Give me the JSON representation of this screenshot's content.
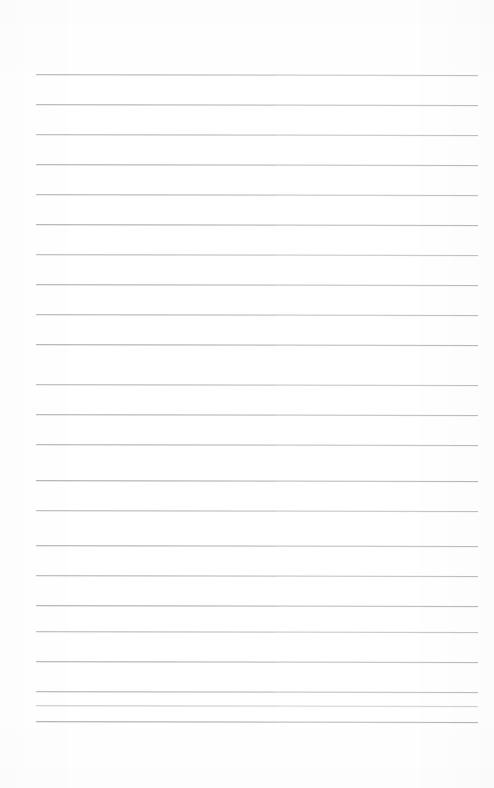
{
  "page": {
    "kind": "ruled-notebook-paper-scan",
    "width": 494,
    "height": 788,
    "background_color": "#ffffff",
    "content_text": "",
    "visible_text_count": 0
  },
  "ruling": {
    "line_color": "#b9b9bd",
    "line_thickness": 1,
    "line_count": 23,
    "line_spacing": 30.1,
    "first_line_y": 74,
    "last_line_y": 721,
    "line_left_x": 36,
    "line_right_x": 478,
    "line_width": 442,
    "slant_degrees": 0.12,
    "lines": [
      {
        "index": 1,
        "y": 74,
        "x": 36,
        "width": 442,
        "color": "#bcbcc0",
        "opacity": 0.95
      },
      {
        "index": 2,
        "y": 104,
        "x": 36,
        "width": 442,
        "color": "#babac0",
        "opacity": 0.97
      },
      {
        "index": 3,
        "y": 134,
        "x": 36,
        "width": 442,
        "color": "#bcbcc1",
        "opacity": 0.93
      },
      {
        "index": 4,
        "y": 164,
        "x": 36,
        "width": 442,
        "color": "#b9b9be",
        "opacity": 0.98
      },
      {
        "index": 5,
        "y": 194,
        "x": 36,
        "width": 442,
        "color": "#bbbbc0",
        "opacity": 0.95
      },
      {
        "index": 6,
        "y": 224,
        "x": 36,
        "width": 442,
        "color": "#b8b8bd",
        "opacity": 1.0
      },
      {
        "index": 7,
        "y": 254,
        "x": 36,
        "width": 442,
        "color": "#bdbdc2",
        "opacity": 0.9
      },
      {
        "index": 8,
        "y": 284,
        "x": 36,
        "width": 442,
        "color": "#b9b9be",
        "opacity": 0.97
      },
      {
        "index": 9,
        "y": 314,
        "x": 36,
        "width": 442,
        "color": "#bbbbbf",
        "opacity": 0.95
      },
      {
        "index": 10,
        "y": 344,
        "x": 36,
        "width": 442,
        "color": "#b8b8bd",
        "opacity": 1.0
      },
      {
        "index": 11,
        "y": 384,
        "x": 36,
        "width": 442,
        "color": "#bcbcc1",
        "opacity": 0.92
      },
      {
        "index": 12,
        "y": 414,
        "x": 36,
        "width": 442,
        "color": "#b9b9be",
        "opacity": 0.97
      },
      {
        "index": 13,
        "y": 444,
        "x": 36,
        "width": 442,
        "color": "#bababf",
        "opacity": 0.96
      },
      {
        "index": 14,
        "y": 480,
        "x": 36,
        "width": 442,
        "color": "#b7b7bc",
        "opacity": 1.0
      },
      {
        "index": 15,
        "y": 510,
        "x": 36,
        "width": 442,
        "color": "#bcbcc1",
        "opacity": 0.92
      },
      {
        "index": 16,
        "y": 545,
        "x": 36,
        "width": 442,
        "color": "#b9b9be",
        "opacity": 0.97
      },
      {
        "index": 17,
        "y": 575,
        "x": 36,
        "width": 442,
        "color": "#bbbbc0",
        "opacity": 0.94
      },
      {
        "index": 18,
        "y": 605,
        "x": 36,
        "width": 442,
        "color": "#b8b8bd",
        "opacity": 1.0
      },
      {
        "index": 19,
        "y": 631,
        "x": 36,
        "width": 442,
        "color": "#bdbdc2",
        "opacity": 0.9
      },
      {
        "index": 20,
        "y": 661,
        "x": 36,
        "width": 442,
        "color": "#b9b9be",
        "opacity": 0.97
      },
      {
        "index": 21,
        "y": 691,
        "x": 36,
        "width": 442,
        "color": "#bababf",
        "opacity": 0.96
      },
      {
        "index": 22,
        "y": 705,
        "x": 36,
        "width": 442,
        "color": "#c2c2c6",
        "opacity": 0.75
      },
      {
        "index": 23,
        "y": 721,
        "x": 36,
        "width": 442,
        "color": "#b5b5ba",
        "opacity": 1.0
      }
    ]
  },
  "margins": {
    "top": 74,
    "bottom": 67,
    "left": 36,
    "right": 16
  }
}
